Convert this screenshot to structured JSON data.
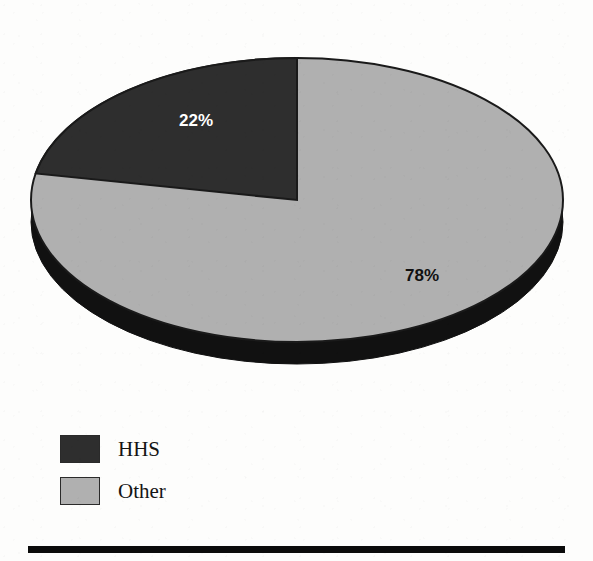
{
  "title": "",
  "chart_data": {
    "type": "pie",
    "title": "",
    "subtitle": "",
    "xlabel": "",
    "ylabel": "",
    "labels": [
      "HHS",
      "Other"
    ],
    "values": [
      22,
      78
    ],
    "value_labels": [
      "22%",
      "78%"
    ],
    "units": "percent",
    "total": 100,
    "legend_position": "bottom-left",
    "grid": false,
    "style": "3d-pie",
    "start_angle_deg": 0,
    "direction": "counterclockwise",
    "slices": [
      {
        "name": "HHS",
        "value": 22,
        "label": "22%",
        "color": "#2e2e2e",
        "label_color": "#ffffff"
      },
      {
        "name": "Other",
        "value": 78,
        "label": "78%",
        "color": "#b0b0b0",
        "label_color": "#111111"
      }
    ]
  },
  "legend": {
    "items": [
      {
        "label": "HHS",
        "color": "#2e2e2e"
      },
      {
        "label": "Other",
        "color": "#b0b0b0"
      }
    ]
  },
  "colors": {
    "hhs": "#2e2e2e",
    "other": "#b0b0b0",
    "depth": "#111111",
    "outline": "#1a1a1a",
    "rule": "#0b0b0b",
    "page_background": "#fdfdfc"
  }
}
